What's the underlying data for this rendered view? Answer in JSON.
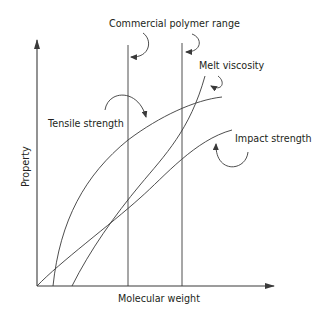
{
  "figure": {
    "title_label": "Commercial polymer range",
    "x_axis_label": "Molecular weight",
    "y_axis_label": "Property",
    "curves": [
      {
        "id": "tensile",
        "label": "Tensile strength"
      },
      {
        "id": "melt",
        "label": "Melt viscosity"
      },
      {
        "id": "impact",
        "label": "Impact strength"
      }
    ],
    "colors": {
      "line": "#3a3a3a",
      "text": "#231f20",
      "background": "#ffffff"
    }
  }
}
